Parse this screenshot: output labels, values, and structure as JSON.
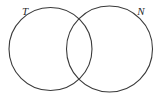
{
  "figure": {
    "type": "venn-diagram",
    "background_color": "#ffffff",
    "stroke_color": "#3a3a3a",
    "label_color": "#2b2b2b",
    "stroke_width": 1.1,
    "width": 165,
    "height": 95
  },
  "sets": [
    {
      "id": "left",
      "label": "T",
      "cx": 50.5,
      "cy": 49,
      "r": 41.5,
      "label_x": 25,
      "label_y": 12,
      "fill": "none"
    },
    {
      "id": "right",
      "label": "N",
      "cx": 109.5,
      "cy": 49,
      "r": 43,
      "label_x": 141,
      "label_y": 12,
      "fill": "none"
    }
  ],
  "regions": {
    "left_only_label": "",
    "intersection_label": "",
    "right_only_label": ""
  }
}
